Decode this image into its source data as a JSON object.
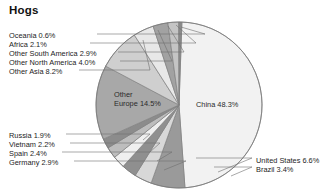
{
  "title": "Hogs",
  "chart_data": {
    "type": "pie",
    "title": "Hogs",
    "unit": "%",
    "legend": "none",
    "grid": false,
    "categories": [
      "China",
      "United States",
      "Brazil",
      "Germany",
      "Spain",
      "Vietnam",
      "Russia",
      "Other Europe",
      "Other Asia",
      "Other North America",
      "Other South America",
      "Africa",
      "Oceania"
    ],
    "values": [
      48.3,
      6.6,
      3.4,
      2.9,
      2.4,
      2.2,
      1.9,
      14.5,
      8.2,
      4.0,
      2.9,
      2.1,
      0.6
    ],
    "labels": [
      "China 48.3%",
      "United States 6.6%",
      "Brazil 3.4%",
      "Germany 2.9%",
      "Spain 2.4%",
      "Vietnam 2.2%",
      "Russia 1.9%",
      "Other Europe 14.5%",
      "Other Asia 8.2%",
      "Other North America 4.0%",
      "Other South America 2.9%",
      "Africa 2.1%",
      "Oceania 0.6%"
    ],
    "colors": [
      "#f2f2f2",
      "#9a9a9a",
      "#d8d8d8",
      "#8f8f8f",
      "#efefef",
      "#bdbdbd",
      "#8c8c8c",
      "#a8a8a8",
      "#cfcfcf",
      "#e8e8e8",
      "#a2a2a2",
      "#c4c4c4",
      "#8a8a8a"
    ],
    "start_angle_deg": -88,
    "direction": "clockwise"
  },
  "labels_left_top": [
    {
      "text": "Oceania 0.6%",
      "x": 9,
      "y": 31
    },
    {
      "text": "Africa 2.1%",
      "x": 9,
      "y": 40
    },
    {
      "text": "Other South America 2.9%",
      "x": 9,
      "y": 49
    },
    {
      "text": "Other North America 4.0%",
      "x": 9,
      "y": 58
    },
    {
      "text": "Other Asia 8.2%",
      "x": 9,
      "y": 67
    }
  ],
  "labels_left_bottom": [
    {
      "text": "Russia 1.9%",
      "x": 9,
      "y": 131
    },
    {
      "text": "Vietnam 2.2%",
      "x": 9,
      "y": 140
    },
    {
      "text": "Spain 2.4%",
      "x": 9,
      "y": 149
    },
    {
      "text": "Germany 2.9%",
      "x": 9,
      "y": 158
    }
  ],
  "labels_right": [
    {
      "text": "United States 6.6%",
      "x": 256,
      "y": 156
    },
    {
      "text": "Brazil 3.4%",
      "x": 256,
      "y": 165
    }
  ],
  "labels_inside": [
    {
      "text": "China 48.3%",
      "x": 196,
      "y": 100
    },
    {
      "text": "Other",
      "x": 114,
      "y": 90
    },
    {
      "text": "Europe 14.5%",
      "x": 114,
      "y": 99
    }
  ],
  "leaders_left_top": [
    {
      "x1": 97,
      "y1": 34,
      "x2": 205,
      "y2": 34,
      "tx": 181,
      "ty": 27
    },
    {
      "x1": 90,
      "y1": 43,
      "x2": 196,
      "y2": 43,
      "tx": 176,
      "ty": 25
    },
    {
      "x1": 118,
      "y1": 52,
      "x2": 184,
      "y2": 52,
      "tx": 168,
      "ty": 26
    },
    {
      "x1": 120,
      "y1": 61,
      "x2": 172,
      "y2": 61,
      "tx": 158,
      "ty": 30
    },
    {
      "x1": 79,
      "y1": 70,
      "x2": 150,
      "y2": 70,
      "tx": 143,
      "ty": 40
    }
  ],
  "leaders_left_bottom": [
    {
      "x1": 66,
      "y1": 134,
      "x2": 150,
      "y2": 134,
      "tx": 143,
      "ty": 140
    },
    {
      "x1": 70,
      "y1": 143,
      "x2": 160,
      "y2": 143,
      "tx": 150,
      "ty": 152
    },
    {
      "x1": 62,
      "y1": 152,
      "x2": 172,
      "y2": 152,
      "tx": 157,
      "ty": 161
    },
    {
      "x1": 74,
      "y1": 161,
      "x2": 186,
      "y2": 161,
      "tx": 164,
      "ty": 170
    }
  ],
  "leaders_right": [
    {
      "x1": 196,
      "y1": 158,
      "x2": 252,
      "y2": 158,
      "tx": 218,
      "ty": 172
    },
    {
      "x1": 214,
      "y1": 167,
      "x2": 252,
      "y2": 167,
      "tx": 231,
      "ty": 176
    }
  ],
  "style": {
    "stroke": "#808080",
    "leader_stroke": "#6e6e6e",
    "background": "#ffffff"
  },
  "geometry": {
    "cx": 179,
    "cy": 105,
    "r": 83
  }
}
